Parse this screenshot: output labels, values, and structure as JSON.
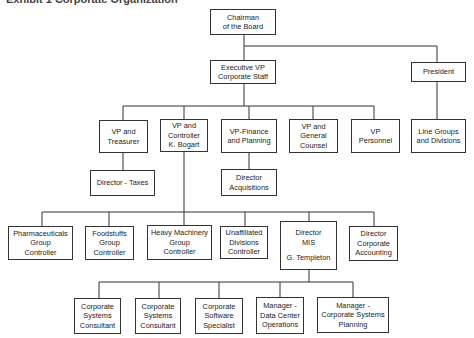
{
  "title": "Exhibit 1 Corporate Organization",
  "nodes": {
    "chairman": [
      "Chairman",
      "of the Board"
    ],
    "exec_vp": [
      "Executive VP",
      "Corporate Staff"
    ],
    "president": [
      "President"
    ],
    "vp_treasurer": [
      "VP and",
      "Treasurer"
    ],
    "vp_controller": [
      "VP and",
      "Controller",
      "K. Bogart"
    ],
    "vp_finance": [
      "VP-Finance",
      "and Planning"
    ],
    "vp_counsel": [
      "VP and",
      "General",
      "Counsel"
    ],
    "vp_personnel": [
      "VP",
      "Personnel"
    ],
    "line_groups": [
      "Line Groups",
      "and Divisions"
    ],
    "dir_taxes": [
      "Director - Taxes"
    ],
    "dir_acq": [
      "Director",
      "Acquisitions"
    ],
    "pharma": [
      "Pharmaceuticals",
      "Group",
      "Controller"
    ],
    "foodstuffs": [
      "Foodstuffs",
      "Group",
      "Controller"
    ],
    "heavy": [
      "Heavy Machinery",
      "Group",
      "Controller"
    ],
    "unaffiliated": [
      "Unaffiliated",
      "Divisions",
      "Controller"
    ],
    "dir_mis": [
      "Director",
      "MIS",
      "G. Templeton"
    ],
    "dir_acct": [
      "Director",
      "Corporate",
      "Accounting"
    ],
    "csc1": [
      "Corporate",
      "Systems",
      "Consultant"
    ],
    "csc2": [
      "Corporate",
      "Systems",
      "Consultant"
    ],
    "css": [
      "Corporate",
      "Software",
      "Specialist"
    ],
    "mgr_dc": [
      "Manager -",
      "Data Center",
      "Operations"
    ],
    "mgr_csp": [
      "Manager -",
      "Corporate Systems",
      "Planning"
    ]
  }
}
